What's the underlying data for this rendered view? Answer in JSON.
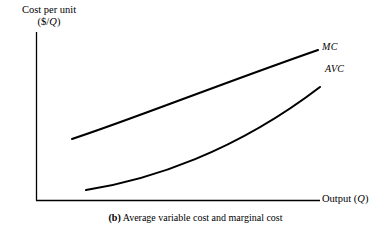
{
  "figure": {
    "caption_tag": "(b)",
    "caption_text": "Average variable cost and marginal cost",
    "background_color": "#ffffff",
    "ink_color": "#000000"
  },
  "axes": {
    "y_label_line1": "Cost per unit",
    "y_label_line2_prefix": "($/",
    "y_label_line2_var": "Q",
    "y_label_line2_suffix": ")",
    "x_label_prefix": "Output (",
    "x_label_var": "Q",
    "x_label_suffix": ")"
  },
  "curves": [
    {
      "id": "mc",
      "label": "MC",
      "name": "marginal-cost-curve",
      "color": "#000000",
      "stroke_width": 2.1,
      "path": "M 72 139 C 130 120, 215 86, 318 50"
    },
    {
      "id": "avc",
      "label": "AVC",
      "name": "average-variable-cost-curve",
      "color": "#000000",
      "stroke_width": 2.1,
      "path": "M 86 190 C 150 180, 235 152, 320 87"
    }
  ],
  "chart_data": {
    "type": "line",
    "title": "(b) Average variable cost and marginal cost",
    "xlabel": "Output (Q)",
    "ylabel": "Cost per unit ($/Q)",
    "grid": false,
    "legend": "inline-curve-labels",
    "axis_style": "schematic-no-tick-values",
    "xlim": [
      0,
      1
    ],
    "ylim": [
      0,
      1
    ],
    "series": [
      {
        "name": "MC",
        "description": "Marginal cost: rises steadily, nearly linear with slight upward convexity; lies above AVC over the entire plotted range.",
        "x": [
          0.13,
          0.28,
          0.45,
          0.63,
          0.8,
          1.0
        ],
        "y": [
          0.36,
          0.45,
          0.55,
          0.65,
          0.75,
          0.89
        ]
      },
      {
        "name": "AVC",
        "description": "Average variable cost: rises at an increasing rate (convex), starting low and steepening toward the right.",
        "x": [
          0.18,
          0.33,
          0.5,
          0.68,
          0.85,
          1.01
        ],
        "y": [
          0.06,
          0.12,
          0.2,
          0.32,
          0.5,
          0.67
        ]
      }
    ]
  }
}
